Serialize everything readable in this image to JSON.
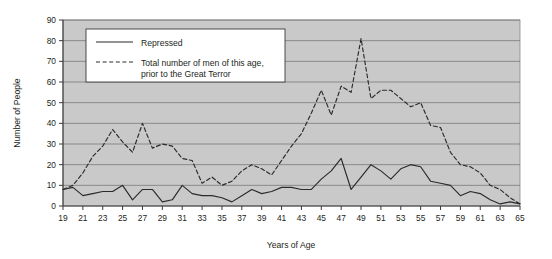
{
  "chart_data": {
    "type": "line",
    "title": "",
    "xlabel": "Years of Age",
    "ylabel": "Number of People",
    "xlim": [
      19,
      65
    ],
    "ylim": [
      0,
      90
    ],
    "grid": true,
    "grid_axis": "y",
    "legend_position": "top-left-inside",
    "plot_background": "#c9c9c9",
    "line_color": "#2b2b2b",
    "xticks": [
      19,
      21,
      23,
      25,
      27,
      29,
      31,
      33,
      35,
      37,
      39,
      41,
      43,
      45,
      47,
      49,
      51,
      53,
      55,
      57,
      59,
      61,
      63,
      65
    ],
    "xtick_labels": [
      "19",
      "21",
      "23",
      "25",
      "27",
      "29",
      "31",
      "33",
      "35",
      "37",
      "39",
      "41",
      "43",
      "45",
      "47",
      "49",
      "51",
      "53",
      "55",
      "57",
      "59",
      "61",
      "63",
      "65"
    ],
    "yticks": [
      0,
      10,
      20,
      30,
      40,
      50,
      60,
      70,
      80,
      90
    ],
    "ytick_labels": [
      "0",
      "10",
      "20",
      "30",
      "40",
      "50",
      "60",
      "70",
      "80",
      "90"
    ],
    "x": [
      19,
      20,
      21,
      22,
      23,
      24,
      25,
      26,
      27,
      28,
      29,
      30,
      31,
      32,
      33,
      34,
      35,
      36,
      37,
      38,
      39,
      40,
      41,
      42,
      43,
      44,
      45,
      46,
      47,
      48,
      49,
      50,
      51,
      52,
      53,
      54,
      55,
      56,
      57,
      58,
      59,
      60,
      61,
      62,
      63,
      64,
      65
    ],
    "series": [
      {
        "name": "Repressed",
        "style": "solid",
        "values": [
          8,
          9,
          5,
          6,
          7,
          7,
          10,
          3,
          8,
          8,
          2,
          3,
          10,
          6,
          5,
          5,
          4,
          2,
          5,
          8,
          6,
          7,
          9,
          9,
          8,
          8,
          13,
          17,
          23,
          8,
          14,
          20,
          17,
          13,
          18,
          20,
          19,
          12,
          11,
          10,
          5,
          7,
          6,
          3,
          1,
          2,
          1
        ]
      },
      {
        "name": "Total number of men of this age, prior to the Great Terror",
        "style": "dashed",
        "values": [
          8,
          10,
          16,
          24,
          29,
          37,
          31,
          26,
          40,
          28,
          30,
          29,
          23,
          22,
          11,
          14,
          10,
          12,
          17,
          20,
          18,
          15,
          22,
          29,
          35,
          45,
          56,
          44,
          58,
          55,
          81,
          52,
          56,
          56,
          52,
          48,
          50,
          39,
          38,
          26,
          20,
          19,
          16,
          10,
          8,
          4,
          1
        ]
      }
    ]
  },
  "legend": {
    "entries": [
      {
        "label": "Repressed",
        "style": "solid"
      },
      {
        "label": "Total number of men of this age,",
        "label_line2": "prior to the Great Terror",
        "style": "dashed"
      }
    ]
  }
}
